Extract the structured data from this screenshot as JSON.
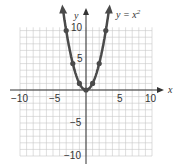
{
  "chart_data": {
    "type": "line",
    "title": "",
    "equation_label": "y = x²",
    "xlabel": "x",
    "ylabel": "y",
    "xlim": [
      -10,
      10
    ],
    "ylim": [
      -10,
      10
    ],
    "grid": true,
    "x_ticks": [
      "-10",
      "-5",
      "5",
      "10"
    ],
    "y_ticks": [
      "10",
      "5",
      "-5",
      "-10"
    ],
    "series": [
      {
        "name": "y = x^2",
        "x": [
          -3,
          -2,
          -1,
          0,
          1,
          2,
          3
        ],
        "y": [
          9,
          4,
          1,
          0,
          1,
          4,
          9
        ]
      }
    ]
  },
  "labels": {
    "equation_prefix": "y = x",
    "equation_exp": "2",
    "x_axis": "x",
    "y_axis": "y",
    "tick_xm10": "−10",
    "tick_xm5": "−5",
    "tick_x5": "5",
    "tick_x10": "10",
    "tick_y10": "10",
    "tick_y5": "5",
    "tick_ym5": "−5",
    "tick_ym10": "−10"
  },
  "colors": {
    "curve": "#4a4a4a",
    "grid": "#c8c8c8",
    "axis": "#333333"
  }
}
